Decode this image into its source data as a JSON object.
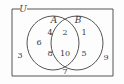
{
  "figure": {
    "type": "venn-diagram",
    "stroke_color": "#555555",
    "text_color": "#3a3a3a",
    "background_color": "#fdfdfd"
  },
  "labels": {
    "universe": "U",
    "set_a": "A",
    "set_b": "B"
  },
  "regions": {
    "outside": {
      "name": "outside-both-sets",
      "elements": [
        "3",
        "9",
        "7"
      ]
    },
    "a_only": {
      "name": "set-a-only",
      "elements": [
        "6",
        "4",
        "8"
      ]
    },
    "intersection": {
      "name": "a-intersect-b",
      "elements": [
        "2",
        "10"
      ]
    },
    "b_only": {
      "name": "set-b-only",
      "elements": [
        "1",
        "5"
      ]
    }
  },
  "elements": {
    "outside_left": "3",
    "outside_right": "9",
    "outside_bottom": "7",
    "a_left": "6",
    "a_top": "4",
    "a_bottom": "8",
    "inter_top": "2",
    "inter_bottom": "10",
    "b_top": "1",
    "b_bottom": "5"
  }
}
